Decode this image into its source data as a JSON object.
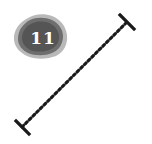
{
  "badge": {
    "label": "11",
    "color": "#5a5a5a",
    "edge_color": "#9a9a9a",
    "text_color": "#ffffff"
  },
  "connector": {
    "style": "dotted",
    "start": {
      "x": 22,
      "y": 127
    },
    "end": {
      "x": 127,
      "y": 22
    },
    "line_color": "#b4b4b4",
    "dot_color": "#1a1a1a",
    "cap_color": "#1a1a1a"
  }
}
